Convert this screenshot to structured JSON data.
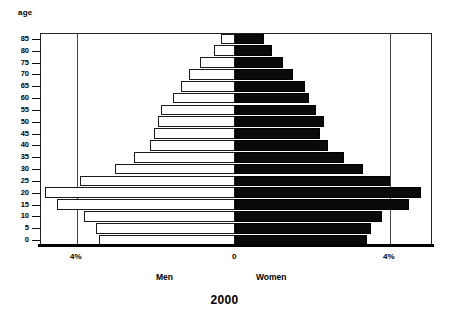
{
  "chart_data": {
    "type": "bar",
    "subtype": "population-pyramid",
    "title": "2000",
    "xlabel": "",
    "ylabel": "age",
    "axis_title": "age",
    "categories": [
      "0",
      "5",
      "10",
      "15",
      "20",
      "25",
      "30",
      "35",
      "40",
      "45",
      "50",
      "55",
      "60",
      "65",
      "70",
      "75",
      "80",
      "85"
    ],
    "category_order_top_to_bottom": [
      "85",
      "80",
      "75",
      "70",
      "65",
      "60",
      "55",
      "50",
      "45",
      "40",
      "35",
      "30",
      "25",
      "20",
      "15",
      "10",
      "5",
      "0"
    ],
    "xlim": [
      -5,
      5
    ],
    "xticks": [
      -4,
      0,
      4
    ],
    "xtick_labels": [
      "4%",
      "0",
      "4%"
    ],
    "grid": "vertical gridlines at -4% and +4%",
    "legend_position": "below axis",
    "series": [
      {
        "name": "Men",
        "side": "left",
        "color": "#ffffff",
        "edge_color": "#1a1a1a",
        "values": [
          3.5,
          3.6,
          3.9,
          4.6,
          4.9,
          4.0,
          3.1,
          2.6,
          2.2,
          2.1,
          2.0,
          1.9,
          1.6,
          1.4,
          1.2,
          0.9,
          0.55,
          0.35
        ]
      },
      {
        "name": "Women",
        "side": "right",
        "color": "#0a0a0a",
        "edge_color": "#000000",
        "values": [
          3.4,
          3.5,
          3.8,
          4.5,
          4.8,
          4.0,
          3.3,
          2.8,
          2.4,
          2.2,
          2.3,
          2.1,
          1.9,
          1.8,
          1.5,
          1.25,
          0.95,
          0.75
        ]
      }
    ]
  },
  "axis": {
    "age_title": "age",
    "age_ticks": [
      "85",
      "80",
      "75",
      "70",
      "65",
      "60",
      "55",
      "50",
      "45",
      "40",
      "35",
      "30",
      "25",
      "20",
      "15",
      "10",
      "5",
      "0"
    ],
    "x_left_label": "4%",
    "x_zero_label": "0",
    "x_right_label": "4%"
  },
  "legend": {
    "men": "Men",
    "women": "Women"
  },
  "title": {
    "year": "2000"
  }
}
